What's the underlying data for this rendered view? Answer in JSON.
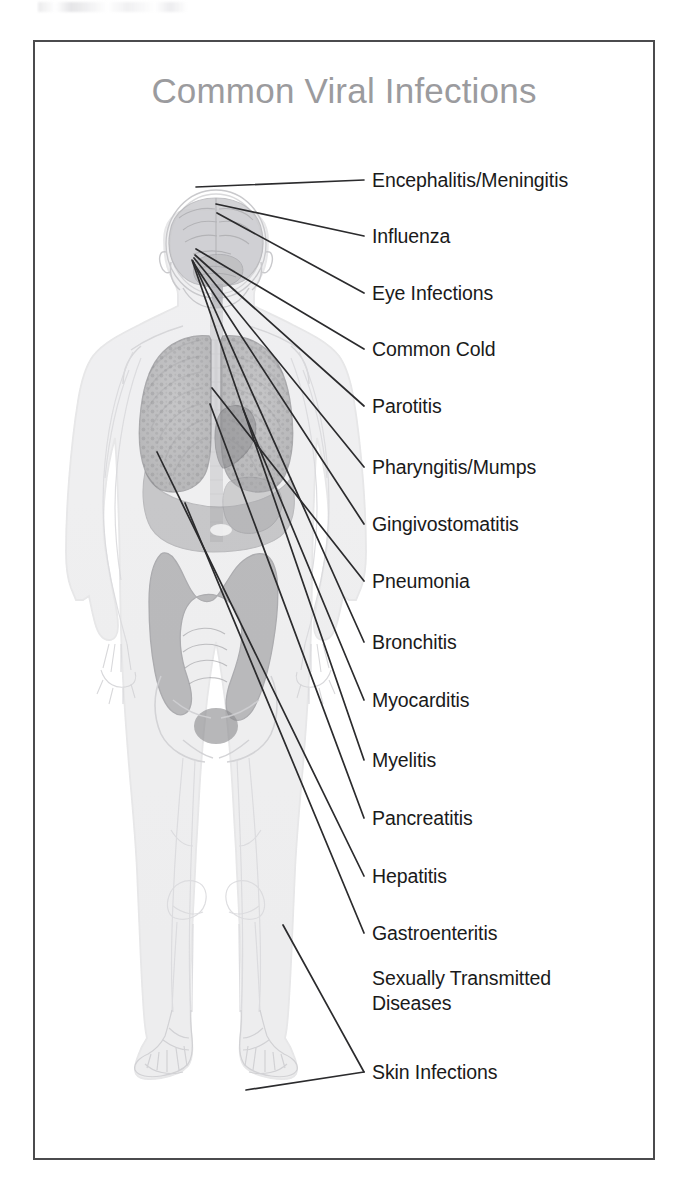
{
  "document": {
    "title": "Common Viral Infections",
    "title_color": "#9b9b9e",
    "frame_color": "#4b4b4d",
    "background_color": "#ffffff",
    "label_color": "#1a1a1a",
    "leader_line_color": "#2b2b2d"
  },
  "figure": {
    "name": "human-body-anatomical-silhouette",
    "silhouette_color": "#d8d8da",
    "organ_fill_color": "#9a9a9c",
    "organ_light_fill_color": "#c2c2c4",
    "brain_fill_color": "#cfcfd1"
  },
  "labels": [
    {
      "id": "encephalitis-meningitis",
      "text": "Encephalitis/Meningitis",
      "x": 372,
      "y": 168,
      "anchor_x": 368,
      "anchor_y": 180,
      "target_x": 196,
      "target_y": 187
    },
    {
      "id": "influenza",
      "text": "Influenza",
      "x": 372,
      "y": 224,
      "anchor_x": 368,
      "anchor_y": 236,
      "target_x": 216,
      "target_y": 204
    },
    {
      "id": "eye-infections",
      "text": "Eye Infections",
      "x": 372,
      "y": 281,
      "anchor_x": 368,
      "anchor_y": 293,
      "target_x": 217,
      "target_y": 213
    },
    {
      "id": "common-cold",
      "text": "Common Cold",
      "x": 372,
      "y": 337,
      "anchor_x": 368,
      "anchor_y": 349,
      "target_x": 196,
      "target_y": 249
    },
    {
      "id": "parotitis",
      "text": "Parotitis",
      "x": 372,
      "y": 394,
      "anchor_x": 368,
      "anchor_y": 406,
      "target_x": 195,
      "target_y": 255
    },
    {
      "id": "pharyngitis-mumps",
      "text": "Pharyngitis/Mumps",
      "x": 372,
      "y": 455,
      "anchor_x": 368,
      "anchor_y": 467,
      "target_x": 194,
      "target_y": 258
    },
    {
      "id": "gingivostomatitis",
      "text": "Gingivostomatitis",
      "x": 372,
      "y": 512,
      "anchor_x": 368,
      "anchor_y": 524,
      "target_x": 193,
      "target_y": 262
    },
    {
      "id": "pneumonia",
      "text": "Pneumonia",
      "x": 372,
      "y": 569,
      "anchor_x": 368,
      "anchor_y": 581,
      "target_x": 212,
      "target_y": 388
    },
    {
      "id": "bronchitis",
      "text": "Bronchitis",
      "x": 372,
      "y": 630,
      "anchor_x": 368,
      "anchor_y": 642,
      "target_x": 193,
      "target_y": 261
    },
    {
      "id": "myocarditis",
      "text": "Myocarditis",
      "x": 372,
      "y": 688,
      "anchor_x": 368,
      "anchor_y": 700,
      "target_x": 243,
      "target_y": 409
    },
    {
      "id": "myelitis",
      "text": "Myelitis",
      "x": 372,
      "y": 748,
      "anchor_x": 368,
      "anchor_y": 760,
      "target_x": 192,
      "target_y": 260
    },
    {
      "id": "pancreatitis",
      "text": "Pancreatitis",
      "x": 372,
      "y": 806,
      "anchor_x": 368,
      "anchor_y": 818,
      "target_x": 210,
      "target_y": 404
    },
    {
      "id": "hepatitis",
      "text": "Hepatitis",
      "x": 372,
      "y": 864,
      "anchor_x": 368,
      "anchor_y": 876,
      "target_x": 157,
      "target_y": 452
    },
    {
      "id": "gastroenteritis",
      "text": "Gastroenteritis",
      "x": 372,
      "y": 921,
      "anchor_x": 368,
      "anchor_y": 933,
      "target_x": 185,
      "target_y": 503
    },
    {
      "id": "sexually-transmitted-diseases",
      "text": "Sexually Transmitted\nDiseases",
      "x": 372,
      "y": 966,
      "anchor_x": 368,
      "anchor_y": 1070,
      "target_x": 283,
      "target_y": 925
    },
    {
      "id": "skin-infections",
      "text": "Skin Infections",
      "x": 372,
      "y": 1060,
      "anchor_x": 368,
      "anchor_y": 1072,
      "target_x": 246,
      "target_y": 1090
    }
  ]
}
